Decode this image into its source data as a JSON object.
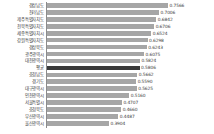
{
  "chart_data": {
    "type": "bar",
    "orientation": "horizontal",
    "title": "",
    "subtitle": "",
    "xlabel": "",
    "ylabel": "",
    "grid": false,
    "legend": false,
    "xlim": [
      0,
      0.7566
    ],
    "value_format": "0.0000",
    "highlight_category": "전국 평균",
    "highlight_color": "#3a3a3a",
    "bar_color": "#a6a6a6",
    "categories": [
      "경상남도",
      "전라남도",
      "제주특별자치도",
      "전북특별자치도",
      "세종특별자치시",
      "강원특별자치도",
      "경상북도",
      "광주광역시",
      "대전광역시",
      "평균",
      "충청남도",
      "경기도",
      "대구광역시",
      "인천광역시",
      "서울특별시",
      "충청북도",
      "부산광역시",
      "울산광역시"
    ],
    "values": [
      0.7566,
      0.7006,
      0.6842,
      0.6706,
      0.6524,
      0.6298,
      0.6243,
      0.6075,
      0.5824,
      0.5806,
      0.5662,
      0.559,
      0.5625,
      0.516,
      0.4707,
      0.466,
      0.4487,
      0.3904
    ],
    "value_labels": [
      "0.7566",
      "0.7006",
      "0.6842",
      "0.6706",
      "0.6524",
      "0.6298",
      "0.6243",
      "0.6075",
      "0.5824",
      "0.5806",
      "0.5662",
      "0.5590",
      "0.5625",
      "0.5160",
      "0.4707",
      "0.4660",
      "0.4487",
      "0.3904"
    ]
  },
  "footer": {
    "note": ""
  }
}
